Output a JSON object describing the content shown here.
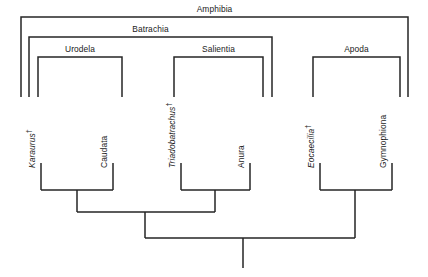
{
  "figure": {
    "type": "cladogram",
    "line_color": "#262626",
    "background_color": "#ffffff",
    "text_color": "#1a1a1a"
  },
  "clade_brackets": [
    {
      "id": "amphibia",
      "label": "Amphibia",
      "left": 21,
      "right": 408,
      "top": 17,
      "bottom": 97
    },
    {
      "id": "batrachia",
      "label": "Batrachia",
      "left": 29,
      "right": 272,
      "top": 37,
      "bottom": 97
    },
    {
      "id": "urodela",
      "label": "Urodela",
      "left": 38,
      "right": 122,
      "top": 57,
      "bottom": 97
    },
    {
      "id": "salientia",
      "label": "Salientia",
      "left": 174,
      "right": 263,
      "top": 57,
      "bottom": 97
    },
    {
      "id": "apoda",
      "label": "Apoda",
      "left": 313,
      "right": 400,
      "top": 57,
      "bottom": 97
    }
  ],
  "tips": [
    {
      "id": "karaurus",
      "label": "Karaurus",
      "extinct": true,
      "dagger": "†",
      "x": 41
    },
    {
      "id": "caudata",
      "label": "Caudata",
      "extinct": false,
      "dagger": "",
      "x": 113
    },
    {
      "id": "triadobatrachus",
      "label": "Triadobatrachus",
      "extinct": true,
      "dagger": "†",
      "x": 181
    },
    {
      "id": "anura",
      "label": "Anura",
      "extinct": false,
      "dagger": "",
      "x": 250
    },
    {
      "id": "eocaecilia",
      "label": "Eocaecilia",
      "extinct": true,
      "dagger": "†",
      "x": 320
    },
    {
      "id": "gymnophiona",
      "label": "Gymnophiona",
      "extinct": false,
      "dagger": "",
      "x": 392
    }
  ],
  "tree_geometry": {
    "tip_line_top": 163,
    "tip_line_bottom": 190,
    "node_urodela": {
      "left": 41,
      "right": 113,
      "y": 190,
      "stem_x": 77,
      "stem_bottom": 212
    },
    "node_salientia": {
      "left": 181,
      "right": 250,
      "y": 190,
      "stem_x": 215,
      "stem_bottom": 212
    },
    "node_apoda": {
      "left": 320,
      "right": 392,
      "y": 190,
      "stem_x": 355,
      "stem_bottom": 238
    },
    "node_batrachia": {
      "left": 77,
      "right": 215,
      "y": 212,
      "stem_x": 145,
      "stem_bottom": 238
    },
    "node_amphibia": {
      "left": 145,
      "right": 355,
      "y": 238,
      "stem_x": 243,
      "stem_bottom": 268
    }
  }
}
